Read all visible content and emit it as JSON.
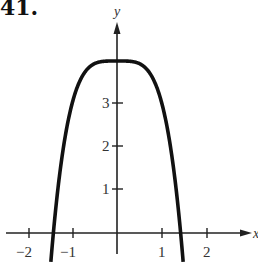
{
  "problem": {
    "number": "41."
  },
  "chart_data": {
    "type": "line",
    "title": "",
    "xlabel": "x",
    "ylabel": "y",
    "function_shape": "y = 4 - x^4",
    "x": [
      -1.414,
      -1.3,
      -1.2,
      -1.1,
      -1.0,
      -0.8,
      -0.6,
      -0.4,
      -0.2,
      0,
      0.2,
      0.4,
      0.6,
      0.8,
      1.0,
      1.1,
      1.2,
      1.3,
      1.414
    ],
    "series": [
      {
        "name": "curve",
        "values": [
          0,
          1.14,
          1.93,
          2.54,
          3.0,
          3.59,
          3.87,
          3.97,
          4.0,
          4.0,
          4.0,
          3.97,
          3.87,
          3.59,
          3.0,
          2.54,
          1.93,
          1.14,
          0
        ]
      }
    ],
    "x_ticks": [
      "-2",
      "-1",
      "1",
      "2"
    ],
    "y_ticks": [
      "1",
      "2",
      "3"
    ],
    "xlim": [
      -2.5,
      3.0
    ],
    "ylim": [
      -0.5,
      4.9
    ],
    "grid": false,
    "legend": "none"
  },
  "axes": {
    "x_label": "x",
    "y_label": "y",
    "x_tick_labels": {
      "neg2": "−2",
      "neg1": "−1",
      "pos1": "1",
      "pos2": "2"
    },
    "y_tick_labels": {
      "one": "1",
      "two": "2",
      "three": "3"
    }
  }
}
